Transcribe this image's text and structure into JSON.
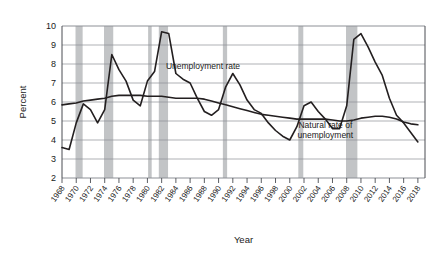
{
  "chart_data": {
    "type": "line",
    "title": "",
    "xlabel": "Year",
    "ylabel": "Percent",
    "ylim": [
      2,
      10
    ],
    "ytick_step": 1,
    "yticks": [
      "10",
      "9",
      "8",
      "7",
      "6",
      "5",
      "4",
      "3",
      "2"
    ],
    "xlim": [
      1968,
      2019
    ],
    "grid": true,
    "legend_position": "inline-annotations",
    "xticks": [
      "1968",
      "1970",
      "1972",
      "1974",
      "1976",
      "1978",
      "1980",
      "1982",
      "1984",
      "1986",
      "1988",
      "1990",
      "1992",
      "1994",
      "1996",
      "1998",
      "2000",
      "2002",
      "2004",
      "2006",
      "2008",
      "2010",
      "2012",
      "2014",
      "2016",
      "2018"
    ],
    "annotations": [
      {
        "name": "unemployment-rate-label",
        "text": "Unemployment rate",
        "x": 1982.6,
        "y": 7.75
      },
      {
        "name": "natural-rate-label",
        "line1": "Natural rate of",
        "line2": "unemployment",
        "x": 2005.0,
        "y": 4.62
      }
    ],
    "recessions": [
      {
        "start": 1969.9,
        "end": 1970.9
      },
      {
        "start": 1973.9,
        "end": 1975.2
      },
      {
        "start": 1980.1,
        "end": 1980.6
      },
      {
        "start": 1981.6,
        "end": 1982.9
      },
      {
        "start": 1990.6,
        "end": 1991.2
      },
      {
        "start": 2001.2,
        "end": 2001.9
      },
      {
        "start": 2007.9,
        "end": 2009.5
      }
    ],
    "recession_color": "#c2c4c6",
    "line_color": "#231f20",
    "grid_color": "#8d9096",
    "x": [
      1968,
      1969,
      1970,
      1971,
      1972,
      1973,
      1974,
      1975,
      1976,
      1977,
      1978,
      1979,
      1980,
      1981,
      1982,
      1983,
      1984,
      1985,
      1986,
      1987,
      1988,
      1989,
      1990,
      1991,
      1992,
      1993,
      1994,
      1995,
      1996,
      1997,
      1998,
      1999,
      2000,
      2001,
      2002,
      2003,
      2004,
      2005,
      2006,
      2007,
      2008,
      2009,
      2010,
      2011,
      2012,
      2013,
      2014,
      2015,
      2016,
      2017,
      2018
    ],
    "series": [
      {
        "name": "Unemployment rate",
        "values": [
          3.6,
          3.5,
          4.9,
          5.9,
          5.6,
          4.9,
          5.6,
          8.5,
          7.7,
          7.1,
          6.1,
          5.8,
          7.1,
          7.6,
          9.7,
          9.6,
          7.5,
          7.2,
          7.0,
          6.2,
          5.5,
          5.3,
          5.6,
          6.8,
          7.5,
          6.9,
          6.1,
          5.6,
          5.4,
          4.9,
          4.5,
          4.2,
          4.0,
          4.7,
          5.8,
          6.0,
          5.5,
          5.1,
          4.6,
          4.6,
          5.8,
          9.3,
          9.6,
          8.9,
          8.1,
          7.4,
          6.2,
          5.3,
          4.9,
          4.4,
          3.9
        ]
      },
      {
        "name": "Natural rate of unemployment",
        "values": [
          5.85,
          5.9,
          5.95,
          6.05,
          6.1,
          6.15,
          6.2,
          6.3,
          6.35,
          6.35,
          6.35,
          6.35,
          6.3,
          6.3,
          6.3,
          6.25,
          6.2,
          6.2,
          6.2,
          6.2,
          6.15,
          6.05,
          5.95,
          5.85,
          5.75,
          5.65,
          5.55,
          5.45,
          5.35,
          5.3,
          5.25,
          5.2,
          5.15,
          5.1,
          5.1,
          5.1,
          5.1,
          5.1,
          5.05,
          5.0,
          5.0,
          5.05,
          5.15,
          5.2,
          5.25,
          5.25,
          5.2,
          5.1,
          4.95,
          4.85,
          4.8
        ]
      }
    ]
  }
}
